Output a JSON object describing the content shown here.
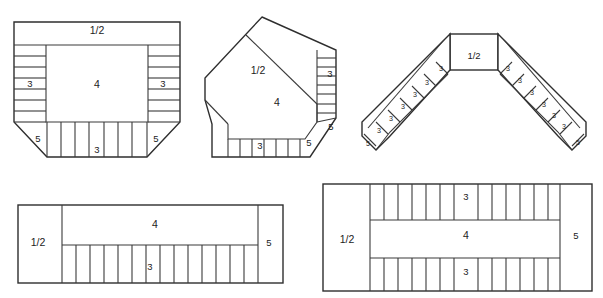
{
  "document": {
    "title": "Brick Bond Layout Diagrams",
    "description": "Five masonry brick bond arrangement plan views showing corner, angled, chevron, single-wall and double-wall layouts with course numbering"
  },
  "labels": {
    "half": "1/2",
    "three": "3",
    "four": "4",
    "five": "5"
  },
  "figures": [
    {
      "id": "figure-1",
      "name": "square-corner-bond",
      "callouts": [
        {
          "text": "1/2",
          "x": 97,
          "y": 31,
          "size": "lg"
        },
        {
          "text": "3",
          "x": 30,
          "y": 84,
          "size": "md"
        },
        {
          "text": "4",
          "x": 97,
          "y": 85,
          "size": "lg"
        },
        {
          "text": "3",
          "x": 163,
          "y": 84,
          "size": "md"
        },
        {
          "text": "5",
          "x": 38,
          "y": 139,
          "size": "md"
        },
        {
          "text": "3",
          "x": 97,
          "y": 150,
          "size": "md"
        },
        {
          "text": "5",
          "x": 156,
          "y": 139,
          "size": "md"
        }
      ]
    },
    {
      "id": "figure-2",
      "name": "angled-corner-bond",
      "callouts": [
        {
          "text": "1/2",
          "x": 258,
          "y": 71,
          "size": "lg"
        },
        {
          "text": "3",
          "x": 330,
          "y": 74,
          "size": "md"
        },
        {
          "text": "4",
          "x": 277,
          "y": 103,
          "size": "lg"
        },
        {
          "text": "5",
          "x": 331,
          "y": 127,
          "size": "md"
        },
        {
          "text": "3",
          "x": 260,
          "y": 146,
          "size": "md"
        },
        {
          "text": "5",
          "x": 309,
          "y": 143,
          "size": "md"
        }
      ]
    },
    {
      "id": "figure-3",
      "name": "chevron-bond",
      "callouts": [
        {
          "text": "1/2",
          "x": 474,
          "y": 56,
          "size": "md"
        },
        {
          "text": "3",
          "x": 441,
          "y": 69,
          "size": "sm"
        },
        {
          "text": "3",
          "x": 427,
          "y": 83,
          "size": "sm"
        },
        {
          "text": "3",
          "x": 415,
          "y": 95,
          "size": "sm"
        },
        {
          "text": "3",
          "x": 403,
          "y": 107,
          "size": "sm"
        },
        {
          "text": "3",
          "x": 391,
          "y": 119,
          "size": "sm"
        },
        {
          "text": "3",
          "x": 379,
          "y": 131,
          "size": "sm"
        },
        {
          "text": "5",
          "x": 368,
          "y": 144,
          "size": "sm"
        },
        {
          "text": "3",
          "x": 508,
          "y": 69,
          "size": "sm"
        },
        {
          "text": "3",
          "x": 520,
          "y": 81,
          "size": "sm"
        },
        {
          "text": "3",
          "x": 532,
          "y": 93,
          "size": "sm"
        },
        {
          "text": "3",
          "x": 544,
          "y": 105,
          "size": "sm"
        },
        {
          "text": "3",
          "x": 554,
          "y": 116,
          "size": "sm"
        },
        {
          "text": "3",
          "x": 564,
          "y": 127,
          "size": "sm"
        },
        {
          "text": "5",
          "x": 578,
          "y": 143,
          "size": "sm"
        }
      ]
    },
    {
      "id": "figure-4",
      "name": "single-wall-bond",
      "callouts": [
        {
          "text": "1/2",
          "x": 38,
          "y": 243,
          "size": "lg"
        },
        {
          "text": "4",
          "x": 155,
          "y": 225,
          "size": "lg"
        },
        {
          "text": "3",
          "x": 150,
          "y": 267,
          "size": "md"
        },
        {
          "text": "5",
          "x": 269,
          "y": 243,
          "size": "md"
        }
      ]
    },
    {
      "id": "figure-5",
      "name": "double-wall-bond",
      "callouts": [
        {
          "text": "1/2",
          "x": 347,
          "y": 240,
          "size": "lg"
        },
        {
          "text": "3",
          "x": 466,
          "y": 197,
          "size": "md"
        },
        {
          "text": "4",
          "x": 466,
          "y": 236,
          "size": "lg"
        },
        {
          "text": "3",
          "x": 466,
          "y": 272,
          "size": "md"
        },
        {
          "text": "5",
          "x": 576,
          "y": 236,
          "size": "md"
        }
      ]
    }
  ],
  "geometry": {
    "figure1": {
      "left": 14,
      "right": 180,
      "top": 22,
      "bottom": 157,
      "header_bottom": 45,
      "side_width": 32,
      "bottom_strip_top": 122,
      "inner_left": 46,
      "inner_right": 148,
      "chamfer": 33,
      "side_course_count": 7,
      "bottom_course_count": 7
    },
    "figure2": {
      "course_count_vertical": 7,
      "course_count_horizontal": 7
    },
    "figure3": {
      "center": {
        "x": 450,
        "y": 34,
        "w": 48,
        "h": 36
      },
      "arm_block_count": 7,
      "arm_angle_deg": 45
    },
    "figure4": {
      "left": 18,
      "right": 283,
      "top": 205,
      "bottom": 283,
      "half_right": 62,
      "five_left": 258,
      "strip_top": 245,
      "strip_count": 14
    },
    "figure5": {
      "left": 323,
      "right": 592,
      "top": 184,
      "bottom": 291,
      "half_right": 370,
      "five_left": 560,
      "upper_strip_bottom": 220,
      "lower_strip_top": 258,
      "strip_count": 14
    }
  },
  "colors": {
    "stroke": "#3a3a3a",
    "outline": "#2e2e2e",
    "fill": "#ffffff",
    "text": "#1c1c1c",
    "background": "#ffffff"
  }
}
